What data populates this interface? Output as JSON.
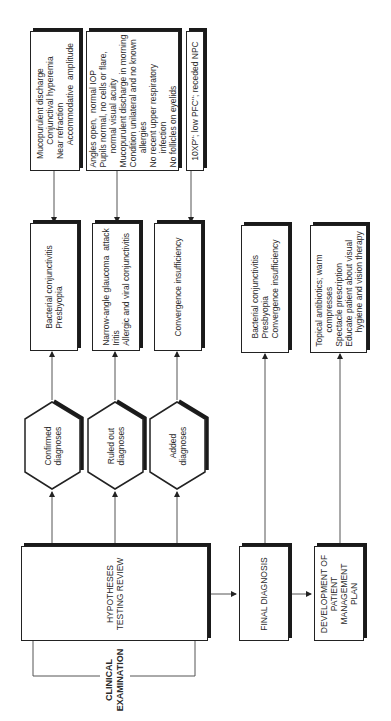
{
  "start": {
    "label": "CLINICAL\nEXAMINATION"
  },
  "hypotheses": {
    "label": "HYPOTHESES\nTESTING REVIEW"
  },
  "categories": [
    {
      "label": "Confirmed\ndiagnoses",
      "diagnoses": "Bacterial conjunctivitis\nPresbyopia",
      "findings": "Mucopurulent discharge\n      Conjunctival hyperemia\nNear refraction\n      Accommodative  amplitude"
    },
    {
      "label": "Ruled out\ndiagnoses",
      "diagnoses": "Narrow-angle glaucoma  attack\nIritis\nAllergic and viral conjunctivitis",
      "findings": "Angles open,  normal IOP\nPupils normal, no cells or flare,\n      normal visual acuity\nMucopurulent discharge in morning\nCondition unilateral and no known\n      allergies\nNo recent upper respiratory\n      infection\nNo follicles on eyelids"
    },
    {
      "label": "Added\ndiagnoses",
      "diagnoses": "Convergence insufficiency",
      "findings": "10XP\"; low PFC\"; receded NPC"
    }
  ],
  "final_diagnosis": {
    "label": "FINAL DIAGNOSIS",
    "detail": "Bacterial conjunctivitis\nPresbyopia\nConvergence insufficiency"
  },
  "management": {
    "label": "DEVELOPMENT OF\nPATIENT\nMANAGEMENT\nPLAN",
    "detail": "Topical antibiotics; warm\n      compresses\nSpectacle prescription\nEducate patient about visual\n      hygiene and vision therapy"
  }
}
